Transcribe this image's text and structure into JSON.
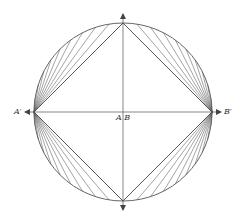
{
  "diagram": {
    "center": {
      "x": 123,
      "y": 112
    },
    "radius": 89,
    "stroke_color": "#555555",
    "fan_count": 10,
    "labels": {
      "left_point": "A′",
      "right_point": "B′",
      "center": "A B"
    }
  }
}
